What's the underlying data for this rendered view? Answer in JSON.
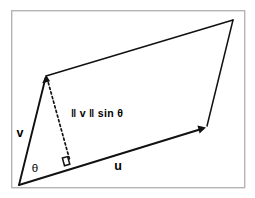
{
  "figure": {
    "background_color": "#ffffff",
    "frame_color": "#b4b4b4",
    "line_color": "#111111"
  },
  "labels": {
    "vector_v": "v",
    "vector_u": "u",
    "angle_theta": "θ",
    "height_expression": "‖ v ‖ sin θ"
  },
  "geometry": {
    "frame": {
      "x": 11,
      "y": 10,
      "width": 234,
      "height": 178
    },
    "origin": {
      "x": 19,
      "y": 185
    },
    "v_tip": {
      "x": 46,
      "y": 76
    },
    "u_tip": {
      "x": 205,
      "y": 128
    },
    "far_corner": {
      "x": 233,
      "y": 20
    },
    "foot_of_height": {
      "x": 70,
      "y": 161
    }
  },
  "annotations": {
    "right_angle_marker": "right-angle",
    "dashed_segment": "perpendicular-height"
  }
}
